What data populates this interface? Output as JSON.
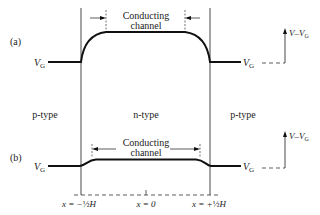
{
  "figure": {
    "panel_a": {
      "label": "(a)",
      "channel_label_line1": "Conducting",
      "channel_label_line2": "channel",
      "left_level_label": "V",
      "left_level_sub": "G",
      "right_level_label": "V",
      "right_level_sub": "G",
      "axis_label": "V–V",
      "axis_label_sub": "G"
    },
    "panel_b": {
      "label": "(b)",
      "channel_label_line1": "Conducting",
      "channel_label_line2": "channel",
      "left_level_label": "V",
      "left_level_sub": "G",
      "right_level_label": "V",
      "right_level_sub": "G",
      "axis_label": "V–V",
      "axis_label_sub": "G"
    },
    "regions": {
      "left": "p-type",
      "middle": "n-type",
      "right": "p-type"
    },
    "x_axis": {
      "left_tick": {
        "prefix": "x = −",
        "frac": "½",
        "var": "H"
      },
      "center_tick": {
        "prefix": "x = 0"
      },
      "right_tick": {
        "prefix": "x = +",
        "frac": "½",
        "var": "H"
      }
    }
  }
}
